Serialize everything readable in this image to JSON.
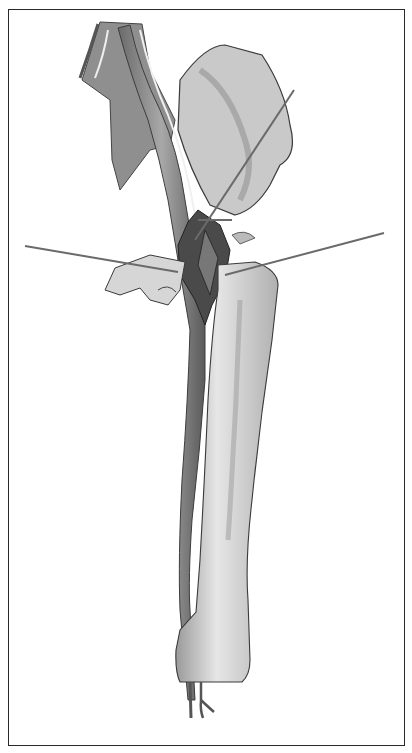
{
  "figure": {
    "background_color": "#ffffff",
    "line_color": "#3a3a3a",
    "shade_dark": "#555555",
    "shade_mid": "#8a8a8a",
    "shade_light": "#d4d4d4"
  }
}
